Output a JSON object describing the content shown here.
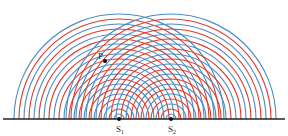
{
  "diagram": {
    "colors": {
      "crest": "#4a8cc8",
      "trough": "#e03a2a",
      "baseline": "#222222",
      "point": "#111111"
    },
    "baseline": {
      "x1": 3,
      "x2": 285,
      "y": 119
    },
    "sources": [
      {
        "id": "S1",
        "label": "S",
        "subscript": "1",
        "x": 119,
        "y": 119
      },
      {
        "id": "S2",
        "label": "S",
        "subscript": "2",
        "x": 171,
        "y": 119
      }
    ],
    "wavefronts": {
      "radius_step": 5,
      "max_radius": 105,
      "count": 21,
      "innermost_color": "crest"
    },
    "point": {
      "label": "P",
      "x": 105,
      "y": 61
    }
  }
}
